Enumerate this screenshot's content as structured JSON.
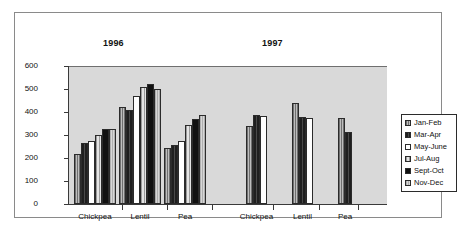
{
  "chart_data": {
    "type": "bar",
    "title": "",
    "xlabel": "",
    "ylabel": "",
    "ylim": [
      0,
      600
    ],
    "yticks": [
      600,
      500,
      400,
      300,
      200,
      100,
      0
    ],
    "grid": false,
    "legend_position": "right",
    "panel_titles": [
      "1996",
      "1997"
    ],
    "categories": [
      "Chickpea",
      "Lentil",
      "Pea"
    ],
    "series": [
      {
        "name": "Jan-Feb",
        "pattern": "gray-hatch"
      },
      {
        "name": "Mar-Apr",
        "pattern": "dark-hatch"
      },
      {
        "name": "May-June",
        "pattern": "white"
      },
      {
        "name": "Jul-Aug",
        "pattern": "light-hatch"
      },
      {
        "name": "Sept-Oct",
        "pattern": "black"
      },
      {
        "name": "Nov-Dec",
        "pattern": "light-gray"
      }
    ],
    "panels": [
      {
        "year": "1996",
        "groups": [
          {
            "category": "Chickpea",
            "bars": [
              {
                "series": "Jan-Feb",
                "value": 218
              },
              {
                "series": "Mar-Apr",
                "value": 265
              },
              {
                "series": "May-June",
                "value": 272
              },
              {
                "series": "Jul-Aug",
                "value": 298
              },
              {
                "series": "Sept-Oct",
                "value": 327
              },
              {
                "series": "Nov-Dec",
                "value": 327
              }
            ]
          },
          {
            "category": "Lentil",
            "bars": [
              {
                "series": "Jan-Feb",
                "value": 420
              },
              {
                "series": "Mar-Apr",
                "value": 410
              },
              {
                "series": "May-June",
                "value": 470
              },
              {
                "series": "Jul-Aug",
                "value": 508
              },
              {
                "series": "Sept-Oct",
                "value": 523
              },
              {
                "series": "Nov-Dec",
                "value": 500
              }
            ]
          },
          {
            "category": "Pea",
            "bars": [
              {
                "series": "Jan-Feb",
                "value": 242
              },
              {
                "series": "Mar-Apr",
                "value": 258
              },
              {
                "series": "May-June",
                "value": 272
              },
              {
                "series": "Jul-Aug",
                "value": 343
              },
              {
                "series": "Sept-Oct",
                "value": 368
              },
              {
                "series": "Nov-Dec",
                "value": 386
              }
            ]
          }
        ]
      },
      {
        "year": "1997",
        "groups": [
          {
            "category": "Chickpea",
            "bars": [
              {
                "series": "Jan-Feb",
                "value": 338
              },
              {
                "series": "Mar-Apr",
                "value": 385
              },
              {
                "series": "May-June",
                "value": 382
              }
            ]
          },
          {
            "category": "Lentil",
            "bars": [
              {
                "series": "Jan-Feb",
                "value": 440
              },
              {
                "series": "Mar-Apr",
                "value": 379
              },
              {
                "series": "May-June",
                "value": 376
              }
            ]
          },
          {
            "category": "Pea",
            "bars": [
              {
                "series": "Jan-Feb",
                "value": 375
              },
              {
                "series": "Mar-Apr",
                "value": 311
              }
            ]
          }
        ]
      }
    ]
  }
}
